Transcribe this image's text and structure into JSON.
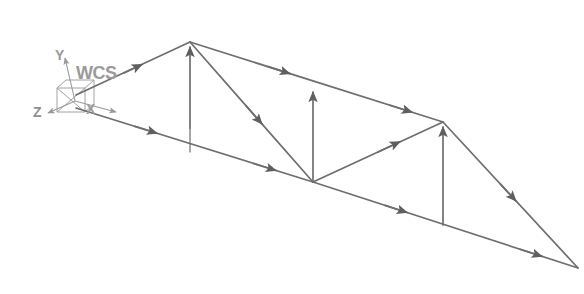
{
  "view": {
    "background_color": "#ffffff",
    "line_color": "#6e6e6e",
    "label_color": "#9a9a9a",
    "width": 584,
    "height": 294
  },
  "wcs": {
    "label": "WCS",
    "origin": [
      75,
      101
    ],
    "axes": [
      {
        "name": "x-axis",
        "label": "X",
        "tip": [
          118,
          112
        ]
      },
      {
        "name": "y-axis",
        "label": "Y",
        "tip": [
          63,
          57
        ]
      },
      {
        "name": "z-axis",
        "label": "Z",
        "tip": [
          44,
          113
        ]
      }
    ],
    "cube": {
      "name": "wcs-cube-glyph",
      "front": [
        [
          57,
          88
        ],
        [
          85,
          88
        ],
        [
          85,
          112
        ],
        [
          57,
          112
        ]
      ],
      "diagonals": [
        [
          [
            57,
            88
          ],
          [
            85,
            112
          ]
        ],
        [
          [
            85,
            88
          ],
          [
            57,
            112
          ]
        ]
      ]
    }
  },
  "structure": {
    "name": "truss-model",
    "nodes": [
      {
        "id": "n1",
        "name": "node-left-top",
        "x": 76,
        "y": 95
      },
      {
        "id": "n2",
        "name": "node-apex",
        "x": 190,
        "y": 42
      },
      {
        "id": "n3",
        "name": "node-mid-top",
        "x": 316,
        "y": 98
      },
      {
        "id": "n4",
        "name": "node-right-top",
        "x": 443,
        "y": 122
      },
      {
        "id": "n5",
        "name": "node-left-bottom",
        "x": 76,
        "y": 108
      },
      {
        "id": "n6",
        "name": "node-apex-base",
        "x": 190,
        "y": 128
      },
      {
        "id": "n7",
        "name": "node-mid-bottom",
        "x": 313,
        "y": 182
      },
      {
        "id": "n8",
        "name": "node-right-base",
        "x": 443,
        "y": 225
      },
      {
        "id": "n9",
        "name": "node-right-tip",
        "x": 578,
        "y": 268
      }
    ],
    "members": [
      {
        "name": "member-top-chord-left",
        "from": "n1",
        "to": "n2",
        "arrow": "mid"
      },
      {
        "name": "member-top-chord-mid",
        "from": "n2",
        "to": "n4",
        "arrow": "mid"
      },
      {
        "name": "member-top-right-rafter",
        "from": "n4",
        "to": "n9",
        "arrow": "mid"
      },
      {
        "name": "member-bottom-chord-left",
        "from": "n5",
        "to": "n7",
        "arrow": "mid"
      },
      {
        "name": "member-bottom-chord-right",
        "from": "n7",
        "to": "n9",
        "arrow": "mid"
      },
      {
        "name": "member-diagonal-apex",
        "from": "n2",
        "to": "n7",
        "arrow": "mid"
      },
      {
        "name": "member-diagonal-right",
        "from": "n7",
        "to": "n4",
        "arrow": "mid"
      },
      {
        "name": "member-vertical-left",
        "from": "n6",
        "to": "n2",
        "arrow": "end"
      },
      {
        "name": "member-vertical-mid",
        "from": "n7",
        "to": "n3",
        "arrow": "end"
      },
      {
        "name": "member-vertical-right",
        "from": "n8",
        "to": "n4",
        "arrow": "end"
      }
    ]
  }
}
